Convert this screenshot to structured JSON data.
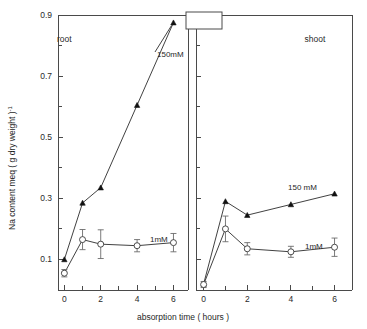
{
  "figure": {
    "background": "#ffffff",
    "ink_color": "#1f1f1f"
  },
  "axis_titles": {
    "y": "Na content  meq ( g dry weight )-1",
    "x": "absorption  time  ( hours )"
  },
  "panels": {
    "left_label": "root",
    "right_label": "shoot"
  },
  "series_labels": {
    "left_high": "150mM",
    "left_low": "1mM",
    "right_high": "150 mM",
    "right_low": "1mM"
  },
  "y_ticks_major": [
    "0.1",
    "0.3",
    "0.5",
    "0.7",
    "0.9"
  ],
  "x_ticks_major": [
    "0",
    "2",
    "4",
    "6"
  ],
  "chart_data": {
    "type": "line",
    "title": "",
    "xlabel": "absorption  time  ( hours )",
    "ylabel": "Na content  meq ( g dry weight )-1",
    "xlim": [
      -0.35,
      6.8
    ],
    "ylim": [
      0.0,
      0.9
    ],
    "grid": false,
    "legend_position": "inline-annotation",
    "y_major_ticks": [
      0.1,
      0.3,
      0.5,
      0.7,
      0.9
    ],
    "y_minor_ticks": [
      0.2,
      0.4,
      0.6,
      0.8
    ],
    "x_major_ticks": [
      0,
      2,
      4,
      6
    ],
    "x_minor_ticks": [
      1,
      3,
      5
    ],
    "panels": [
      {
        "name": "root",
        "label": "root",
        "series": [
          {
            "name": "150mM",
            "marker": "filled-triangle",
            "x": [
              0,
              1,
              2,
              4,
              6
            ],
            "values": [
              0.1,
              0.285,
              0.335,
              0.605,
              0.875
            ],
            "errors": [
              0,
              0,
              0,
              0,
              0
            ]
          },
          {
            "name": "1mM",
            "marker": "open-circle",
            "x": [
              0,
              1,
              2,
              4,
              6
            ],
            "values": [
              0.055,
              0.165,
              0.15,
              0.145,
              0.155
            ],
            "errors": [
              0.012,
              0.033,
              0.047,
              0.02,
              0.03
            ]
          }
        ]
      },
      {
        "name": "shoot",
        "label": "shoot",
        "series": [
          {
            "name": "150 mM",
            "marker": "filled-triangle",
            "x": [
              0,
              1,
              2,
              4,
              6
            ],
            "values": [
              0.02,
              0.29,
              0.245,
              0.28,
              0.315
            ],
            "errors": [
              0,
              0,
              0,
              0,
              0
            ]
          },
          {
            "name": "1mM",
            "marker": "open-circle",
            "x": [
              0,
              1,
              2,
              4,
              6
            ],
            "values": [
              0.018,
              0.2,
              0.135,
              0.125,
              0.14
            ],
            "errors": [
              0.01,
              0.042,
              0.02,
              0.018,
              0.03
            ]
          }
        ]
      }
    ]
  }
}
